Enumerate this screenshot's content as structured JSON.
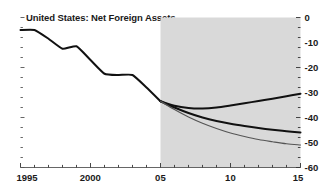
{
  "chart_data": {
    "type": "line",
    "title": "United States: Net Foreign Assets",
    "xlabel": "",
    "ylabel": "",
    "xlim": [
      1995,
      2015
    ],
    "ylim": [
      -60,
      0
    ],
    "ytick_labels": [
      "0",
      "-10",
      "-20",
      "-30",
      "-40",
      "-50",
      "-60"
    ],
    "ytick_values": [
      0,
      -10,
      -20,
      -30,
      -40,
      -50,
      -60
    ],
    "xtick_labels": [
      "1995",
      "2000",
      "05",
      "10",
      "15"
    ],
    "xtick_values": [
      1995,
      2000,
      2005,
      2010,
      2015
    ],
    "xtick_minor_step": 1,
    "grid": false,
    "legend": "none",
    "yaxis_position": "right",
    "shaded_region": {
      "label": "projection",
      "x_start": 2005,
      "x_end": 2015,
      "color": "#d9d9d9"
    },
    "series": [
      {
        "name": "history",
        "color": "#111111",
        "width": 2.0,
        "x": [
          1995,
          1996,
          1997,
          1998,
          1999,
          2000,
          2001,
          2002,
          2003,
          2004,
          2005
        ],
        "values": [
          -5,
          -5,
          -8.5,
          -12.5,
          -11.5,
          -17,
          -22.5,
          -23,
          -23,
          -28,
          -33.5
        ]
      },
      {
        "name": "scenario-upper",
        "color": "#111111",
        "width": 2.0,
        "x": [
          2005,
          2006,
          2007,
          2008,
          2009,
          2010,
          2011,
          2012,
          2013,
          2014,
          2015
        ],
        "values": [
          -33.5,
          -35.3,
          -36.2,
          -36.4,
          -36.0,
          -35.2,
          -34.3,
          -33.4,
          -32.5,
          -31.5,
          -30.5
        ]
      },
      {
        "name": "scenario-middle",
        "color": "#111111",
        "width": 2.0,
        "x": [
          2005,
          2006,
          2007,
          2008,
          2009,
          2010,
          2011,
          2012,
          2013,
          2014,
          2015
        ],
        "values": [
          -33.5,
          -36.0,
          -38.2,
          -40.0,
          -41.4,
          -42.5,
          -43.4,
          -44.2,
          -44.9,
          -45.5,
          -46.0
        ]
      },
      {
        "name": "scenario-lower",
        "color": "#555555",
        "width": 1.2,
        "x": [
          2005,
          2006,
          2007,
          2008,
          2009,
          2010,
          2011,
          2012,
          2013,
          2014,
          2015
        ],
        "values": [
          -33.5,
          -36.8,
          -39.8,
          -42.3,
          -44.4,
          -46.2,
          -47.6,
          -48.8,
          -49.7,
          -50.5,
          -51.0
        ]
      }
    ]
  }
}
